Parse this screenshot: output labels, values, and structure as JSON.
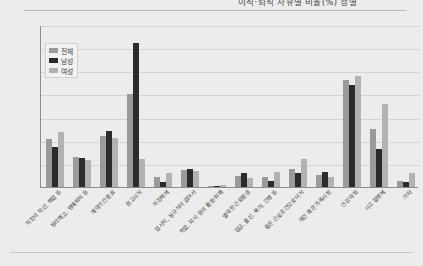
{
  "header": {
    "title": "이직·퇴직 사유별 비율(%) 성별",
    "title_clipped": true
  },
  "legend": {
    "position": "top-left-inside",
    "items": [
      {
        "label": "전체",
        "color": "#9a9a9c"
      },
      {
        "label": "남성",
        "color": "#2b2b2b"
      },
      {
        "label": "여성",
        "color": "#b2b2b4"
      }
    ]
  },
  "axis": {
    "y_ticks": [
      "35",
      "30",
      "25",
      "20",
      "15",
      "10",
      "5",
      "0"
    ],
    "y_min": 0,
    "y_max": 35,
    "y_step": 5
  },
  "chart_data": {
    "type": "bar",
    "title": "이직·퇴직 사유별 비율(%) 성별",
    "xlabel": "",
    "ylabel": "",
    "ylim": [
      0,
      35
    ],
    "grid": true,
    "legend_position": "top-left-inside",
    "categories": [
      "직장의 파산, 폐업 등",
      "정리해고, 명예퇴직 등",
      "계약기간 종료",
      "권고사직",
      "직장폐쇄",
      "임시직, 정규직이 없어서",
      "학업, 지식 등의 활용 위해",
      "열악한 근로환경",
      "임금, 출산, 육아, 간병 등",
      "좋은 근로조건으로 이직",
      "개인 혹은 가족사정",
      "건강 악화",
      "사고 질병에",
      "기타"
    ],
    "series": [
      {
        "name": "전체",
        "color": "#9a9a9c",
        "values": [
          10.4,
          6.4,
          11.0,
          20.0,
          2.2,
          3.6,
          0.3,
          2.4,
          2.2,
          4.0,
          2.6,
          23.1,
          12.5,
          1.4
        ]
      },
      {
        "name": "남성",
        "color": "#2b2b2b",
        "values": [
          8.6,
          6.2,
          12.2,
          31.2,
          1.0,
          3.9,
          0.2,
          3.0,
          1.4,
          3.1,
          3.2,
          22.0,
          8.3,
          1.0
        ]
      },
      {
        "name": "여성",
        "color": "#b2b2b4",
        "values": [
          11.8,
          5.8,
          10.6,
          6.0,
          3.1,
          3.5,
          0.4,
          1.9,
          3.2,
          6.1,
          2.1,
          24.0,
          18.0,
          3.0
        ]
      }
    ]
  }
}
